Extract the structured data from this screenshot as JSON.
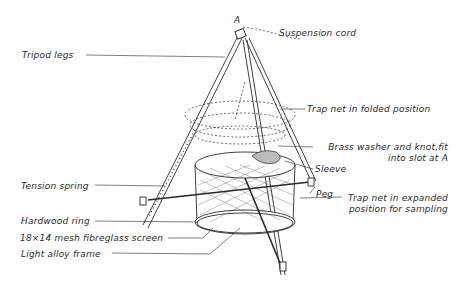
{
  "diagram": {
    "point_marker": "A",
    "labels": {
      "suspension_cord": "Suspension cord",
      "tripod_legs": "Tripod legs",
      "trap_net_folded": "Trap net in folded position",
      "brass_washer_line1": "Brass washer and knot,fit",
      "brass_washer_line2": "into slot at A",
      "sleeve": "Sleeve",
      "tension_spring": "Tension spring",
      "peg": "Peg",
      "trap_net_expanded_line1": "Trap net in expanded",
      "trap_net_expanded_line2": "position for sampling",
      "hardwood_ring": "Hardwood ring",
      "mesh_screen": "18×14 mesh fibreglass screen",
      "light_alloy_frame": "Light alloy frame"
    },
    "colors": {
      "ink": "#2a2a2a",
      "background": "#ffffff"
    }
  }
}
